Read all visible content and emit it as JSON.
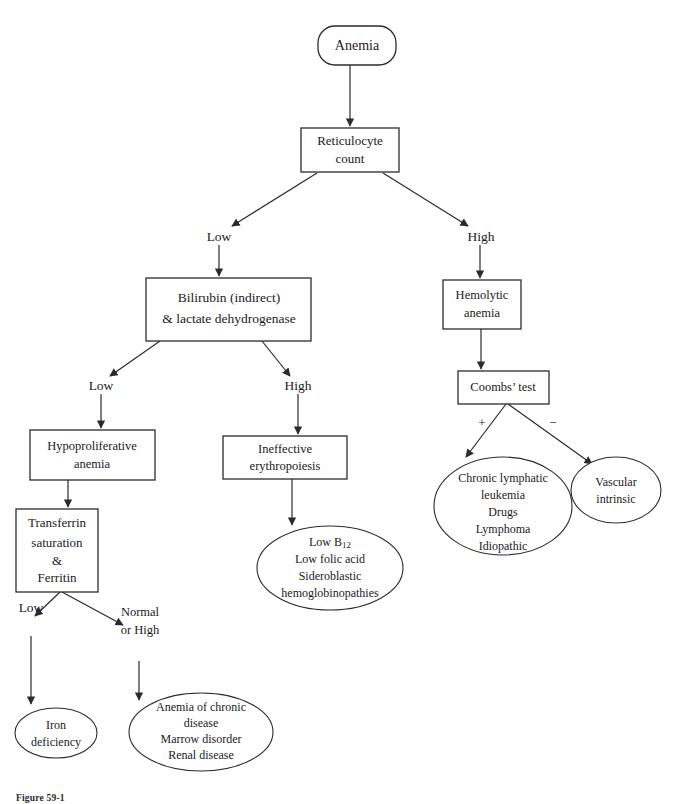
{
  "figure": {
    "caption": "Figure 59-1",
    "line_color": "#2b2b2b",
    "background": "#ffffff"
  },
  "nodes": {
    "anemia": {
      "label": "Anemia",
      "shape": "rounded-rect"
    },
    "reticulocyte_count": {
      "line1": "Reticulocyte",
      "line2": "count",
      "shape": "rect"
    },
    "bilirubin_ldh": {
      "line1": "Bilirubin (indirect)",
      "line2": "& lactate dehydrogenase",
      "shape": "rect"
    },
    "hemolytic_anemia": {
      "line1": "Hemolytic",
      "line2": "anemia",
      "shape": "rect"
    },
    "coombs_test": {
      "label": "Coombs’ test",
      "shape": "rect"
    },
    "hypoproliferative_anemia": {
      "line1": "Hypoproliferative",
      "line2": "anemia",
      "shape": "rect"
    },
    "ineffective_erythropoiesis": {
      "line1": "Ineffective",
      "line2": "erythropoiesis",
      "shape": "rect"
    },
    "transferrin_ferritin": {
      "line1": "Transferrin",
      "line2": "saturation",
      "line3": "&",
      "line4": "Ferritin",
      "shape": "rect"
    },
    "iron_deficiency": {
      "line1": "Iron",
      "line2": "deficiency",
      "shape": "ellipse"
    },
    "chronic_disease_group": {
      "line1": "Anemia of chronic",
      "line2": "disease",
      "line3": "Marrow disorder",
      "line4": "Renal disease",
      "shape": "ellipse"
    },
    "ineffective_causes": {
      "line1_pre": "Low B",
      "line1_sub": "12",
      "line2": "Low folic acid",
      "line3": "Sideroblastic",
      "line4": "hemoglobinopathies",
      "shape": "ellipse"
    },
    "coombs_positive_causes": {
      "line1": "Chronic lymphatic",
      "line2": "leukemia",
      "line3": "Drugs",
      "line4": "Lymphoma",
      "line5": "Idiopathic",
      "shape": "ellipse"
    },
    "coombs_negative_causes": {
      "line1": "Vascular",
      "line2": "intrinsic",
      "shape": "ellipse"
    }
  },
  "edge_labels": {
    "retic_low": "Low",
    "retic_high": "High",
    "bili_low": "Low",
    "bili_high": "High",
    "coombs_positive": "+",
    "coombs_negative": "−",
    "transferrin_low": "Low",
    "transferrin_normal_high_1": "Normal",
    "transferrin_normal_high_2": "or High"
  }
}
